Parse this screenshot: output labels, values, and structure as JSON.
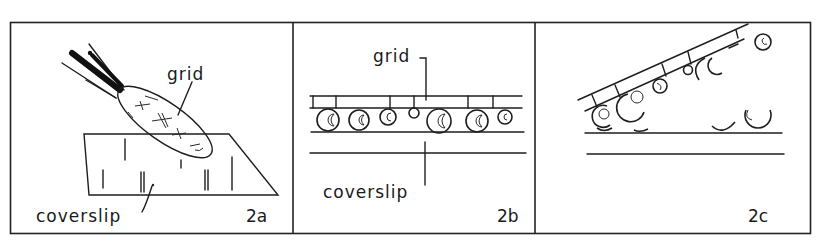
{
  "figure": {
    "panels": [
      {
        "id": "2a",
        "labels": {
          "grid": "grid",
          "coverslip": "coverslip"
        }
      },
      {
        "id": "2b",
        "labels": {
          "grid": "grid",
          "coverslip": "coverslip"
        }
      },
      {
        "id": "2c",
        "labels": {}
      }
    ]
  }
}
